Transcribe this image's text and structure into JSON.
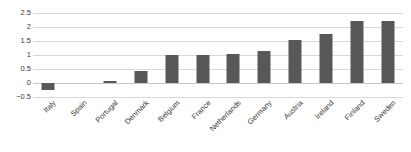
{
  "chart_data": {
    "type": "bar",
    "title": "",
    "subtitle": "",
    "xlabel": "",
    "ylabel": "",
    "categories": [
      "Italy",
      "Spain",
      "Portugal",
      "Denmark",
      "Belgium",
      "France",
      "Netherlands",
      "Germany",
      "Austria",
      "Ireland",
      "Finland",
      "Sweden"
    ],
    "values": [
      -0.25,
      0,
      0.07,
      0.42,
      1.0,
      1.0,
      1.03,
      1.13,
      1.55,
      1.75,
      2.2,
      2.2
    ],
    "series": [
      {
        "name": "",
        "values": [
          -0.25,
          0,
          0.07,
          0.42,
          1.0,
          1.0,
          1.03,
          1.13,
          1.55,
          1.75,
          2.2,
          2.2
        ]
      }
    ],
    "ylim": [
      -0.5,
      2.5
    ],
    "yticks": [
      -0.5,
      0,
      0.5,
      1,
      1.5,
      2,
      2.5
    ],
    "ytick_labels": [
      "-0.5",
      "0",
      "0.5",
      "1",
      "1.5",
      "2",
      "2.5"
    ],
    "xtick_labels": [
      "Italy",
      "Spain",
      "Portugal",
      "Denmark",
      "Belgium",
      "France",
      "Netherlands",
      "Germany",
      "Austria",
      "Ireland",
      "Finland",
      "Sweden"
    ],
    "grid": true,
    "grid_axis": "y",
    "legend": false,
    "legend_position": "none",
    "bar_color": "#585858",
    "grid_color": "#d9d9d9",
    "zero_line_color": "#c8c8c8",
    "text_color": "#3a3a3a",
    "background_color": "#ffffff",
    "xtick_rotation": -45,
    "annotations": []
  }
}
